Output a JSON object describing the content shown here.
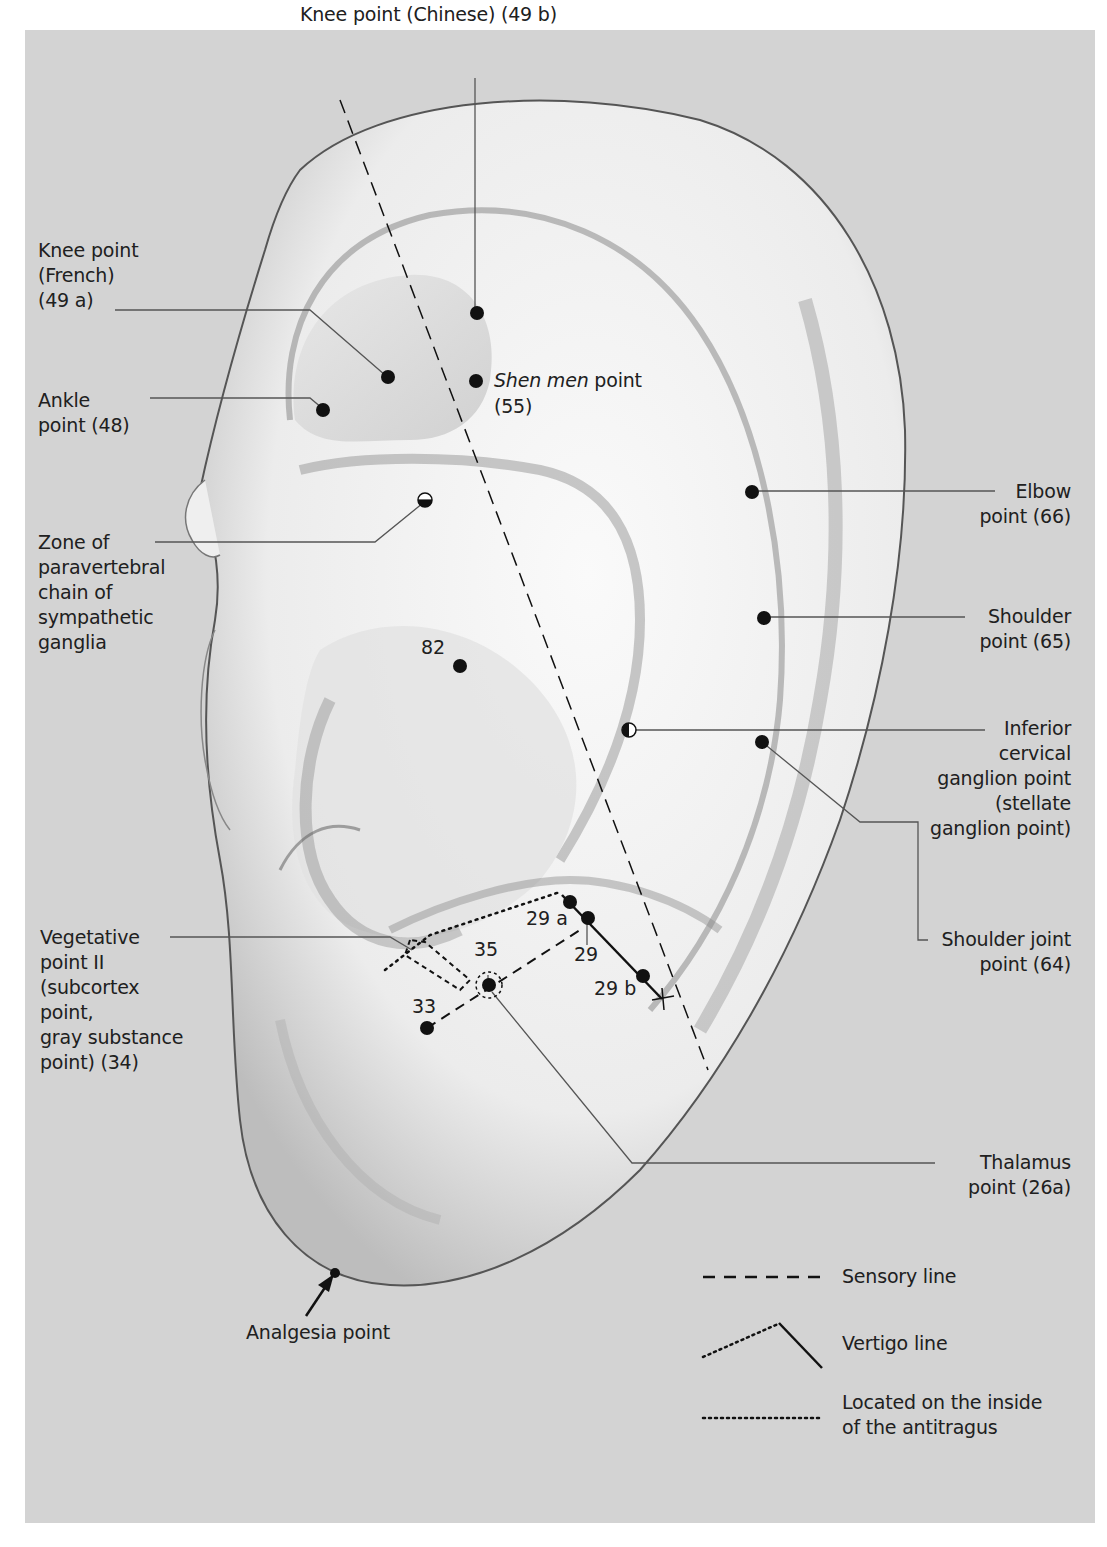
{
  "figure": {
    "background_color": "#d3d3d3",
    "ear_color": "#f2f2f2",
    "ink_color": "#111111"
  },
  "labels": {
    "knee_chinese": "Knee point (Chinese) (49 b)",
    "knee_french": "Knee point\n(French)\n(49 a)",
    "ankle": "Ankle\npoint (48)",
    "shen_men_italic": "Shen men",
    "shen_men_rest": " point",
    "shen_men_num": "(55)",
    "zone_paravertebral": "Zone of\nparavertebral\nchain of\nsympathetic\nganglia",
    "elbow": "Elbow\npoint (66)",
    "shoulder": "Shoulder\npoint (65)",
    "inferior_cervical": "Inferior\ncervical\nganglion point\n(stellate\nganglion point)",
    "shoulder_joint": "Shoulder joint\npoint (64)",
    "vegetative": "Vegetative\npoint II\n(subcortex\npoint,\ngray substance\npoint) (34)",
    "thalamus": "Thalamus\npoint (26a)",
    "analgesia": "Analgesia point"
  },
  "point_numbers": {
    "p82": "82",
    "p29a": "29 a",
    "p29": "29",
    "p29b": "29 b",
    "p35": "35",
    "p33": "33"
  },
  "legend": {
    "items": [
      {
        "style": "dashed",
        "label": "Sensory line"
      },
      {
        "style": "dotted-then-solid",
        "label": "Vertigo line"
      },
      {
        "style": "dotted",
        "label": "Located on the inside\nof the antitragus"
      }
    ]
  }
}
